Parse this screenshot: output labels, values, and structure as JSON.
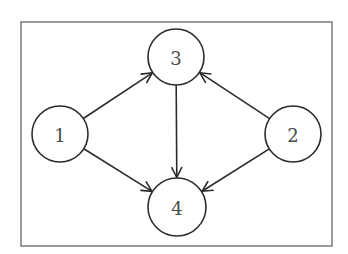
{
  "diagram": {
    "type": "directed-graph",
    "frame": {
      "x": 21,
      "y": 22,
      "width": 311,
      "height": 224,
      "color": "#7a7a7a"
    },
    "colors": {
      "stroke": "#2b2b2b",
      "label": "#4a4a4a",
      "fill": "#ffffff"
    },
    "nodes": [
      {
        "id": "1",
        "label": "1",
        "cx": 60,
        "cy": 134,
        "r": 28
      },
      {
        "id": "2",
        "label": "2",
        "cx": 293,
        "cy": 134,
        "r": 28
      },
      {
        "id": "3",
        "label": "3",
        "cx": 176,
        "cy": 57,
        "r": 28
      },
      {
        "id": "4",
        "label": "4",
        "cx": 177,
        "cy": 207,
        "r": 29
      }
    ],
    "edges": [
      {
        "from": "1",
        "to": "3"
      },
      {
        "from": "1",
        "to": "4"
      },
      {
        "from": "2",
        "to": "3"
      },
      {
        "from": "2",
        "to": "4"
      },
      {
        "from": "3",
        "to": "4"
      }
    ]
  }
}
